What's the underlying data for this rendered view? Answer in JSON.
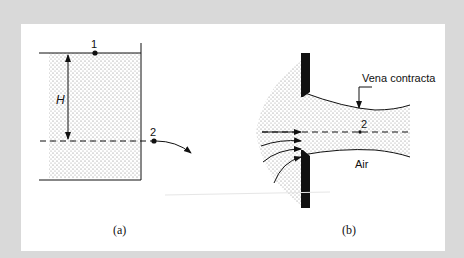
{
  "figure": {
    "frame_color": "#d9d9d9",
    "panel_color": "#ffffff",
    "ink_color": "#111111",
    "panel_a": {
      "caption": "(a)",
      "point_1_label": "1",
      "point_2_label": "2",
      "head_label": "H",
      "description": "Tank draining through side opening; head H between free surface (1) and jet (2)"
    },
    "panel_b": {
      "caption": "(b)",
      "vena_contracta_label": "Vena contracta",
      "air_label": "Air",
      "point_2_label": "2",
      "description": "Sharp-edged orifice with converging streamlines forming vena contracta"
    }
  }
}
